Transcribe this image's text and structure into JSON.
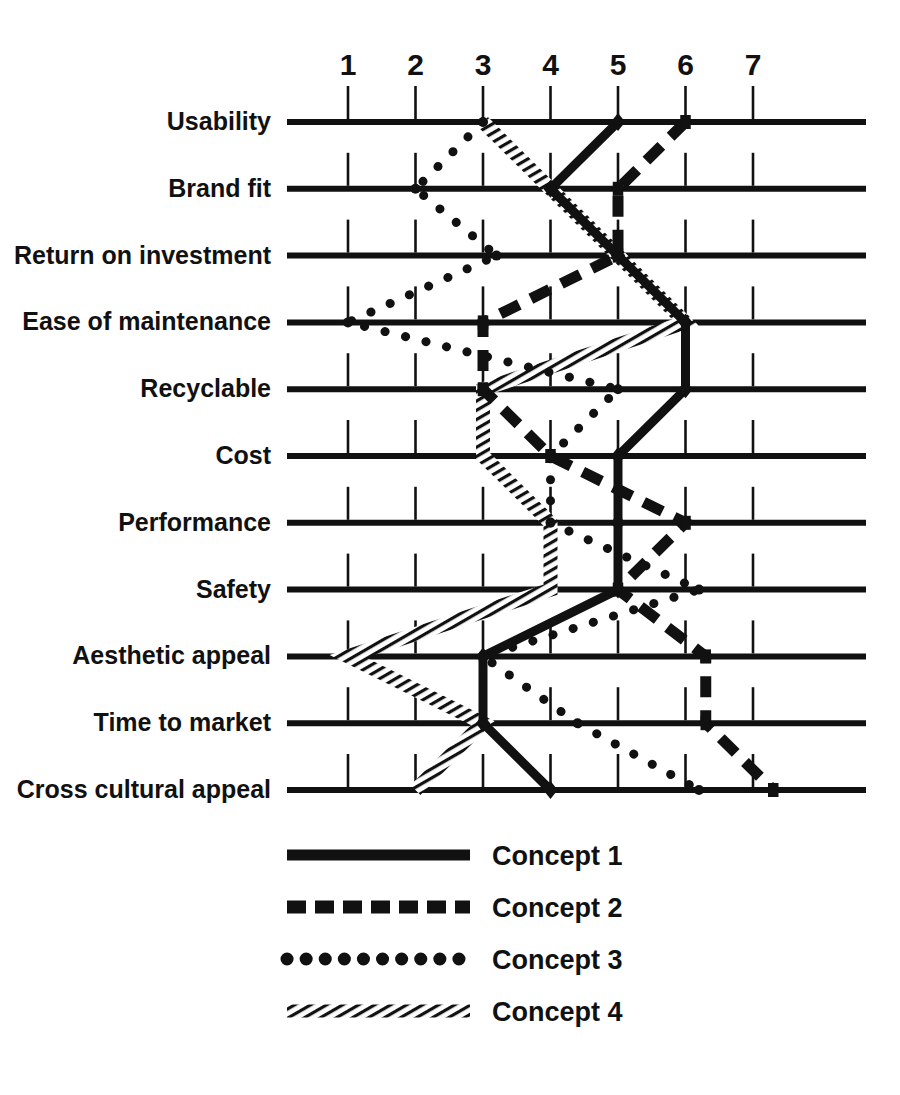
{
  "chart_data": {
    "type": "line",
    "title": "",
    "subtitle": "",
    "xlabel": "",
    "ylabel": "",
    "orientation": "horizontal",
    "xlim": [
      0.5,
      7.6
    ],
    "grid": true,
    "legend_position": "bottom",
    "xticks": [
      "1",
      "2",
      "3",
      "4",
      "5",
      "6",
      "7"
    ],
    "xtick_values": [
      1,
      2,
      3,
      4,
      5,
      6,
      7
    ],
    "categories": [
      "Usability",
      "Brand fit",
      "Return on investment",
      "Ease of maintenance",
      "Recyclable",
      "Cost",
      "Performance",
      "Safety",
      "Aesthetic appeal",
      "Time to market",
      "Cross cultural appeal"
    ],
    "series": [
      {
        "name": "Concept 1",
        "style": "solid",
        "color": "#111111",
        "marker": "diamond",
        "values": [
          5,
          4,
          5,
          6,
          6,
          5,
          5,
          5,
          3,
          3,
          4
        ]
      },
      {
        "name": "Concept 2",
        "style": "dashed",
        "color": "#111111",
        "marker": "square",
        "values": [
          6,
          5,
          5,
          3,
          3,
          4,
          6,
          5,
          6.3,
          6.3,
          7.3
        ]
      },
      {
        "name": "Concept 3",
        "style": "dotted",
        "color": "#111111",
        "marker": "circle",
        "values": [
          3,
          2,
          3.2,
          1,
          5,
          4,
          4,
          6.2,
          3,
          4.4,
          6.2
        ]
      },
      {
        "name": "Concept 4",
        "style": "hatched",
        "color": "#111111",
        "marker": "none",
        "values": [
          3,
          4,
          5,
          6,
          3,
          3,
          4,
          4,
          1,
          3,
          2
        ]
      }
    ]
  },
  "legend": {
    "items": [
      {
        "label": "Concept 1",
        "style": "solid"
      },
      {
        "label": "Concept 2",
        "style": "dashed"
      },
      {
        "label": "Concept 3",
        "style": "dotted"
      },
      {
        "label": "Concept 4",
        "style": "hatched"
      }
    ]
  },
  "geometry": {
    "x_for_value_1": 348,
    "x_step": 67.5,
    "row_y_start": 122,
    "row_step": 66.8,
    "row_line_left": 287,
    "row_line_right": 866,
    "tick_top_offset": -36,
    "axis_num_y": 75
  }
}
